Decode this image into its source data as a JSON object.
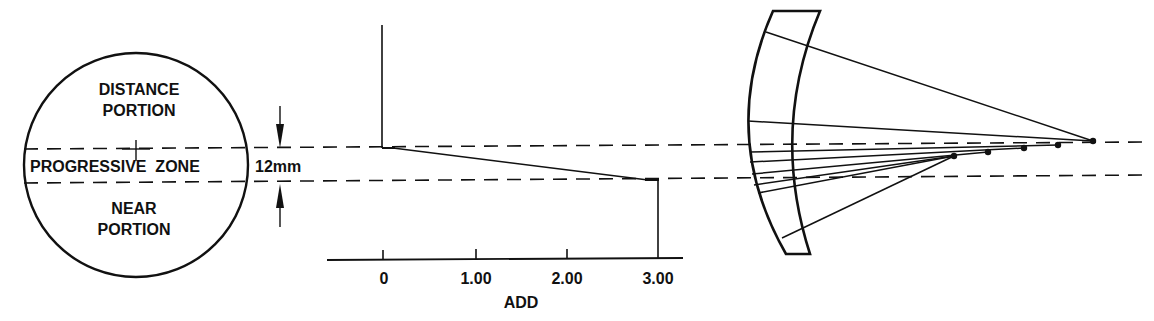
{
  "colors": {
    "ink": "#111111",
    "background": "#ffffff"
  },
  "lens_front_view": {
    "top_label_line1": "DISTANCE",
    "top_label_line2": "PORTION",
    "middle_label": "PROGRESSIVE  ZONE",
    "bottom_label_line1": "NEAR",
    "bottom_label_line2": "PORTION",
    "zone_height_label": "12mm"
  },
  "add_profile": {
    "axis_label": "ADD",
    "ticks": [
      "0",
      "1.00",
      "2.00",
      "3.00"
    ],
    "profile": {
      "start_add": 0,
      "end_add": 3.0
    }
  },
  "lens_cross_section": {
    "description": "Meniscus lens cross-section with rays converging to focal points of increasing power through the progressive zone",
    "focal_point_count": 5
  }
}
